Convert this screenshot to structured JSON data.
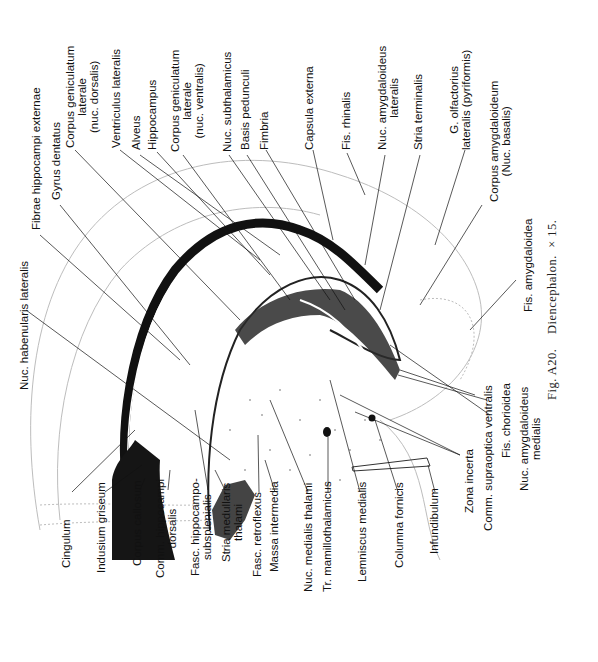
{
  "figure": {
    "caption": {
      "fig_label": "Fig. A20.",
      "title": "Diencephalon.",
      "magnification": "× 15."
    },
    "orientation": "rotated 90° counter-clockwise",
    "labels_top": [
      {
        "id": "nuc-habenularis-lateralis",
        "text": "Nuc. habenularis lateralis"
      },
      {
        "id": "fibrae-hippocampi-externae",
        "text": "Fibrae hippocampi  externae"
      },
      {
        "id": "gyrus-dentatus",
        "text": "Gyrus dentatus"
      },
      {
        "id": "corpus-geniculatum-laterale-dorsalis",
        "lines": [
          "Corpus geniculatum",
          "laterale",
          "(nuc. dorsalis)"
        ]
      },
      {
        "id": "ventriculus-lateralis",
        "text": "Ventriculus lateralis"
      },
      {
        "id": "alveus",
        "text": "Alveus"
      },
      {
        "id": "hippocampus",
        "text": "Hippocampus"
      },
      {
        "id": "corpus-geniculatum-laterale-ventralis",
        "lines": [
          "Corpus geniculatum",
          "laterale",
          "(nuc. ventralis)"
        ]
      },
      {
        "id": "nuc-subthalamicus",
        "text": "Nuc. subthalamicus"
      },
      {
        "id": "basis-pedunculi",
        "text": "Basis pedunculi"
      },
      {
        "id": "fimbria",
        "text": "Fimbria"
      },
      {
        "id": "capsula-externa",
        "text": "Capsula externa"
      },
      {
        "id": "fis-rhinalis",
        "text": "Fis. rhinalis"
      },
      {
        "id": "nuc-amygdaloideus-lateralis",
        "lines": [
          "Nuc. amygdaloideus",
          "lateralis"
        ]
      },
      {
        "id": "stria-terminalis",
        "text": "Stria terminalis"
      },
      {
        "id": "g-olfactorius-lateralis",
        "lines": [
          "G. olfactorius",
          "lateralis (pyriformis)"
        ]
      },
      {
        "id": "corpus-amygdaloideum",
        "lines": [
          "Corpus amygdaloideum",
          "(Nuc. basalis)"
        ]
      },
      {
        "id": "fis-amygdaloidea",
        "text": "Fis. amygdaloidea"
      }
    ],
    "labels_bottom": [
      {
        "id": "cingulum",
        "text": "Cingulum"
      },
      {
        "id": "indusium-griseum",
        "text": "Indusium griseum"
      },
      {
        "id": "corpus-callosum",
        "text": "Corpus callosum"
      },
      {
        "id": "comm-hippocampi-dorsalis",
        "lines": [
          "Comm. hippocampi",
          "dorsalis"
        ]
      },
      {
        "id": "fasc-hippocampo-subsplenialis",
        "lines": [
          "Fasc. hippocampo-",
          "subsplenialis"
        ]
      },
      {
        "id": "stria-medullaris-thalami",
        "lines": [
          "Stria medullaris",
          "thalami"
        ]
      },
      {
        "id": "fasc-retroflexus",
        "text": "Fasc. retroflexus"
      },
      {
        "id": "massa-intermedia",
        "text": "Massa intermedia"
      },
      {
        "id": "nuc-medialis-thalami",
        "text": "Nuc. medialis thalami"
      },
      {
        "id": "tr-mamillothalamicus",
        "text": "Tr. mamillothalamicus"
      },
      {
        "id": "lemniscus-medialis",
        "text": "Lemniscus medialis"
      },
      {
        "id": "columna-fornicis",
        "text": "Columna fornicis"
      },
      {
        "id": "infundibulum",
        "text": "Infundibulum"
      },
      {
        "id": "zona-incerta",
        "text": "Zona incerta"
      },
      {
        "id": "comm-supraoptica-ventralis",
        "text": "Comm. supraoptica ventralis"
      },
      {
        "id": "fis-chorioidea",
        "text": "Fis. chorioidea"
      },
      {
        "id": "nuc-amygdaloideus-medialis",
        "lines": [
          "Nuc. amygdaloideus",
          "medialis"
        ]
      }
    ],
    "colors": {
      "ink": "#111111",
      "light_ink": "#9a9a9a",
      "paper": "#ffffff"
    }
  }
}
